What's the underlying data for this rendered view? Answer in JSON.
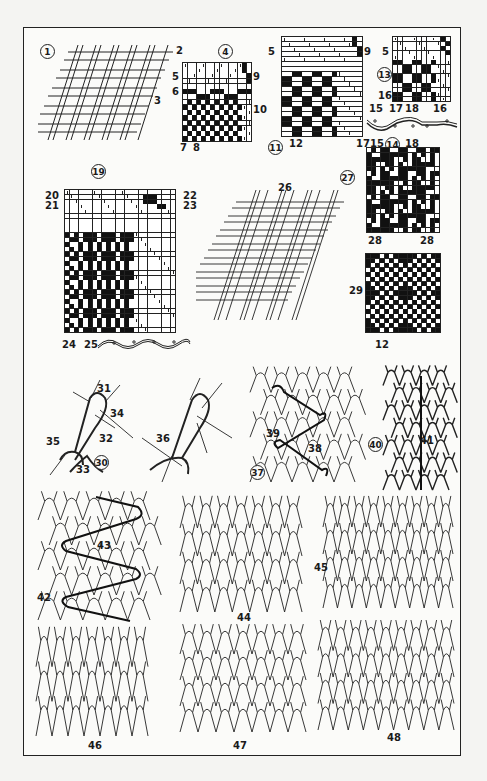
{
  "plate": {
    "description": "Textile construction plate: woven fabric diagrams and weave notations (top), knitted loop structures (bottom)",
    "colors": {
      "ink": "#1a1a1a",
      "paper": "#fbfbf9",
      "background": "#f4f4f2"
    }
  },
  "figures": {
    "fig1": {
      "number": "1",
      "callouts": [
        "2",
        "3"
      ]
    },
    "fig4": {
      "number": "4",
      "callouts": [
        "5",
        "6",
        "7",
        "8",
        "9",
        "10"
      ]
    },
    "fig11": {
      "number": "11",
      "callouts": [
        "5",
        "9",
        "12"
      ]
    },
    "fig13": {
      "number": "13",
      "callouts": [
        "5",
        "16",
        "15",
        "17",
        "18",
        "16"
      ]
    },
    "fig14": {
      "number": "14",
      "callouts": [
        "17",
        "15",
        "18"
      ]
    },
    "fig19": {
      "number": "19",
      "callouts": [
        "20",
        "21",
        "22",
        "23",
        "24",
        "25"
      ]
    },
    "fig26": {
      "label": "26"
    },
    "fig27": {
      "number": "27",
      "callouts": [
        "28",
        "28"
      ]
    },
    "fig29": {
      "label": "29",
      "callouts": [
        "12"
      ]
    },
    "fig30": {
      "number": "30",
      "callouts": [
        "31",
        "34",
        "32",
        "35",
        "33"
      ]
    },
    "fig36": {
      "label": "36"
    },
    "fig37": {
      "number": "37",
      "callouts": [
        "39",
        "38"
      ]
    },
    "fig40": {
      "number": "40",
      "callouts": [
        "41"
      ]
    },
    "fig42": {
      "label": "42",
      "callouts": [
        "43"
      ]
    },
    "fig44": {
      "label": "44"
    },
    "fig45": {
      "label": "45"
    },
    "fig46": {
      "label": "46"
    },
    "fig47": {
      "label": "47"
    },
    "fig48": {
      "label": "48"
    }
  }
}
